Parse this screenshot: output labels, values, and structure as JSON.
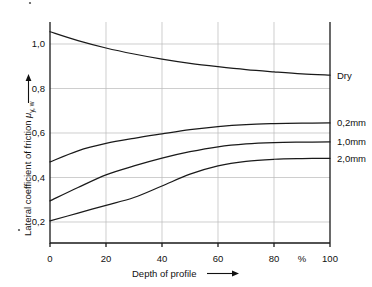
{
  "chart_data": {
    "type": "line",
    "title": "",
    "xlabel": "Depth of profile",
    "ylabel": "Lateral coefficient of friction",
    "ylabel_symbol": "μ",
    "ylabel_symbol_sub": "y, w",
    "x_unit": "%",
    "xlim": [
      0,
      100
    ],
    "ylim": [
      0,
      1.1
    ],
    "grid": true,
    "legend_position": "right-of-axis-inline",
    "x_ticks": [
      0,
      20,
      40,
      60,
      80,
      100
    ],
    "x_tick_labels": [
      "0",
      "20",
      "40",
      "60",
      "80",
      "100"
    ],
    "y_ticks": [
      0.2,
      0.4,
      0.6,
      0.8,
      1.0
    ],
    "y_tick_labels": [
      "0,2",
      "0,4",
      "0,6",
      "0,8",
      "1,0"
    ],
    "x": [
      0,
      10,
      20,
      30,
      40,
      50,
      60,
      70,
      80,
      90,
      100
    ],
    "series": [
      {
        "name": "Dry",
        "label": "Dry",
        "values": [
          1.055,
          1.015,
          0.982,
          0.955,
          0.932,
          0.913,
          0.898,
          0.885,
          0.875,
          0.866,
          0.86
        ]
      },
      {
        "name": "0,2mm",
        "label": "0,2mm",
        "values": [
          0.47,
          0.52,
          0.553,
          0.576,
          0.596,
          0.615,
          0.629,
          0.638,
          0.642,
          0.644,
          0.645
        ]
      },
      {
        "name": "1,0mm",
        "label": "1,0mm",
        "values": [
          0.295,
          0.355,
          0.412,
          0.452,
          0.487,
          0.516,
          0.538,
          0.551,
          0.557,
          0.559,
          0.56
        ]
      },
      {
        "name": "2,0mm",
        "label": "2,0mm",
        "values": [
          0.205,
          0.24,
          0.275,
          0.31,
          0.362,
          0.415,
          0.452,
          0.473,
          0.482,
          0.485,
          0.486
        ]
      }
    ]
  }
}
